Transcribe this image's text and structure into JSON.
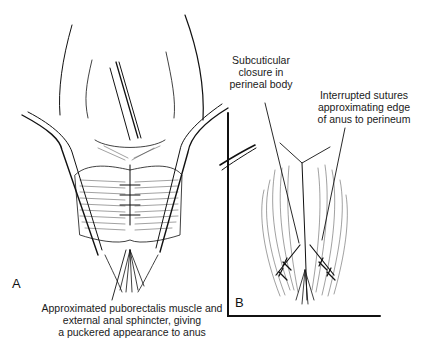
{
  "figure": {
    "panel_a": {
      "letter": "A",
      "caption_lines": [
        "Approximated puborectalis muscle and",
        "external anal sphincter, giving",
        "a puckered appearance to anus"
      ]
    },
    "panel_b": {
      "letter": "B",
      "label_subcuticular": [
        "Subcuticular",
        "closure in",
        "perineal body"
      ],
      "label_interrupted": [
        "Interrupted sutures",
        "approximating edge",
        "of anus to perineum"
      ]
    }
  },
  "colors": {
    "ink": "#111111",
    "background": "#ffffff"
  }
}
